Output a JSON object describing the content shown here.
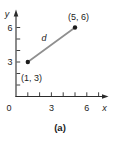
{
  "chart_data": {
    "type": "scatter",
    "points": [
      {
        "x": 1,
        "y": 3,
        "label": "(1, 3)",
        "label_position": "below-left"
      },
      {
        "x": 5,
        "y": 6,
        "label": "(5, 6)",
        "label_position": "above"
      }
    ],
    "segment": {
      "from": [
        1,
        3
      ],
      "to": [
        5,
        6
      ],
      "label": "d"
    },
    "xlabel": "x",
    "ylabel": "y",
    "origin_label": "0",
    "x_axis": {
      "ticks": [
        1,
        2,
        3,
        4,
        5,
        6,
        7
      ],
      "labeled_ticks": [
        3,
        6
      ],
      "range": [
        0,
        7.7
      ]
    },
    "y_axis": {
      "ticks": [
        1,
        2,
        3,
        4,
        5,
        6
      ],
      "labeled_ticks": [
        3,
        6
      ],
      "range": [
        0,
        7.3
      ]
    },
    "caption": "(a)",
    "grid": false,
    "legend": false,
    "colors": {
      "segment": "#8f8f8f",
      "point": "#1c1c1c",
      "axis": "#2b2b2b",
      "text": "#1c1c1c"
    }
  }
}
